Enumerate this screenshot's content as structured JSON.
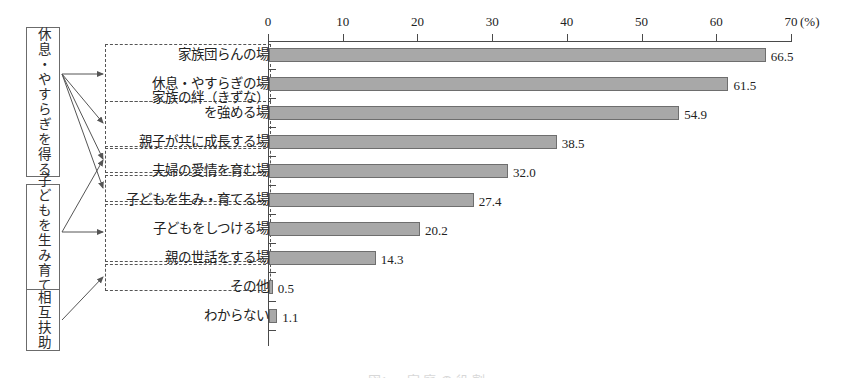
{
  "figure": {
    "background": "#ffffff",
    "bar_fill": "#a8a8a8",
    "bar_stroke": "#6e6e6e",
    "axis_color": "#4a4a4a",
    "caption": "図1 　 家 庭 の 役 割"
  },
  "categories_left": [
    {
      "label": "休息・やすらぎを得る",
      "x": 26,
      "y": 27,
      "w": 34,
      "h": 150
    },
    {
      "label": "子どもを生み育てる",
      "x": 26,
      "y": 184,
      "w": 34,
      "h": 113
    },
    {
      "label": "相互扶助",
      "x": 26,
      "y": 289,
      "w": 34,
      "h": 62
    }
  ],
  "group_boxes": [
    {
      "name": "group-rest",
      "x": 105,
      "y": 44,
      "w": 166,
      "h": 58
    },
    {
      "name": "group-bond",
      "x": 105,
      "y": 101,
      "w": 166,
      "h": 48
    },
    {
      "name": "group-growth",
      "x": 105,
      "y": 146,
      "w": 166,
      "h": 26
    },
    {
      "name": "group-affection",
      "x": 105,
      "y": 175,
      "w": 166,
      "h": 26
    },
    {
      "name": "group-children",
      "x": 105,
      "y": 204,
      "w": 166,
      "h": 58
    },
    {
      "name": "group-care",
      "x": 105,
      "y": 264,
      "w": 166,
      "h": 26
    }
  ],
  "chart_data": {
    "type": "bar",
    "orientation": "horizontal",
    "title": "",
    "xlabel": "(%)",
    "ylabel": "",
    "xlim": [
      0,
      70
    ],
    "xticks": [
      0,
      10,
      20,
      30,
      40,
      50,
      60,
      70
    ],
    "xtick_labels": [
      "0",
      "10",
      "20",
      "30",
      "40",
      "50",
      "60",
      "70"
    ],
    "grid": false,
    "legend": "none",
    "categories": [
      "家族団らんの場",
      "休息・やすらぎの場",
      "家族の絆（きずな）\nを強める場",
      "親子が共に成長する場",
      "夫婦の愛情を育む場",
      "子どもを生み・育てる場",
      "子どもをしつける場",
      "親の世話をする場",
      "その他",
      "わからない"
    ],
    "values": [
      66.5,
      61.5,
      54.9,
      38.5,
      32.0,
      27.4,
      20.2,
      14.3,
      0.5,
      1.1
    ],
    "value_labels": [
      "66.5",
      "61.5",
      "54.9",
      "38.5",
      "32.0",
      "27.4",
      "20.2",
      "14.3",
      "0.5",
      "1.1"
    ]
  },
  "bar_labels": [
    {
      "line1": "家族団らんの場",
      "line2": ""
    },
    {
      "line1": "休息・やすらぎの場",
      "line2": ""
    },
    {
      "line1": "家族の絆（きずな）",
      "line2": "を強める場"
    },
    {
      "line1": "親子が共に成長する場",
      "line2": ""
    },
    {
      "line1": "夫婦の愛情を育む場",
      "line2": ""
    },
    {
      "line1": "子どもを生み・育てる場",
      "line2": ""
    },
    {
      "line1": "子どもをしつける場",
      "line2": ""
    },
    {
      "line1": "親の世話をする場",
      "line2": ""
    },
    {
      "line1": "その他",
      "line2": ""
    },
    {
      "line1": "わからない",
      "line2": ""
    }
  ]
}
